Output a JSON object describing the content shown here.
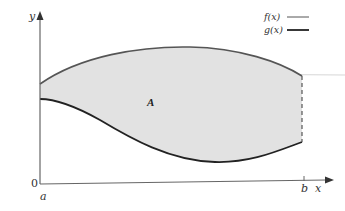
{
  "figure": {
    "region_label": "A",
    "region_fill": "#e2e2e2",
    "axes": {
      "y_label": "y",
      "x_label": "x",
      "origin_label": "0",
      "x_ticks": [
        {
          "label": "a"
        },
        {
          "label": "b"
        }
      ]
    },
    "legend": [
      {
        "label": "f(x)",
        "line_color": "#555555",
        "line_width": 1
      },
      {
        "label": "g(x)",
        "line_color": "#222222",
        "line_width": 2
      }
    ],
    "curves": {
      "f": {
        "name": "f(x)",
        "color": "#555555",
        "role": "upper boundary"
      },
      "g": {
        "name": "g(x)",
        "color": "#222222",
        "role": "lower boundary"
      }
    },
    "right_boundary_style": "dashed"
  }
}
